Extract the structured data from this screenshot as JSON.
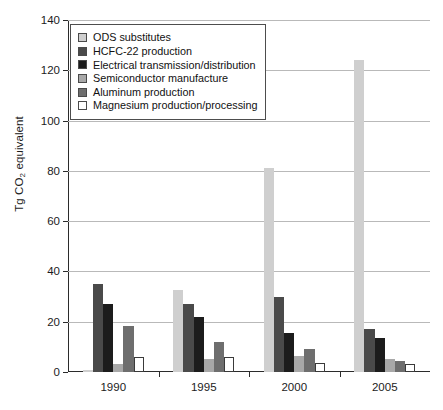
{
  "chart_data": {
    "type": "bar",
    "title": "",
    "subtitle": "",
    "xlabel": "",
    "ylabel": "Tg CO2 equivalent",
    "ylabel_parts": {
      "pre": "Tg CO",
      "sub": "2",
      "post": " equivalent"
    },
    "categories": [
      "1990",
      "1995",
      "2000",
      "2005"
    ],
    "ylim": [
      0,
      140
    ],
    "yticks": [
      0,
      20,
      40,
      60,
      80,
      100,
      120,
      140
    ],
    "ytick_labels": [
      "0",
      "20",
      "40",
      "60",
      "80",
      "100",
      "120",
      "140"
    ],
    "grid": true,
    "grid_axis": "y",
    "legend_position": "upper-left",
    "series": [
      {
        "name": "ODS substitutes",
        "color": "#cfcfcf",
        "values": [
          0.3,
          32.5,
          81.0,
          124.0
        ]
      },
      {
        "name": "HCFC-22 production",
        "color": "#4a4a4a",
        "values": [
          35.0,
          27.0,
          30.0,
          17.0
        ]
      },
      {
        "name": "Electrical transmission/distribution",
        "color": "#1c1c1c",
        "values": [
          27.0,
          22.0,
          15.5,
          13.5
        ]
      },
      {
        "name": "Semiconductor manufacture",
        "color": "#a8a8a8",
        "values": [
          3.0,
          5.0,
          6.5,
          5.0
        ]
      },
      {
        "name": "Aluminum production",
        "color": "#6e6e6e",
        "values": [
          18.5,
          12.0,
          9.0,
          4.5
        ]
      },
      {
        "name": "Magnesium production/processing",
        "color": "#ffffff",
        "values": [
          6.0,
          6.0,
          3.5,
          3.0
        ]
      }
    ]
  },
  "legend": {
    "items": [
      {
        "label": "ODS substitutes",
        "swatch": "#cfcfcf"
      },
      {
        "label": "HCFC-22 production",
        "swatch": "#4a4a4a"
      },
      {
        "label": "Electrical transmission/distribution",
        "swatch": "#1c1c1c"
      },
      {
        "label": "Semiconductor manufacture",
        "swatch": "#a8a8a8"
      },
      {
        "label": "Aluminum production",
        "swatch": "#6e6e6e"
      },
      {
        "label": "Magnesium production/processing",
        "swatch": "#ffffff"
      }
    ]
  },
  "axis_colors": {
    "axis_line": "#2b2b2b",
    "gridline": "#b9b9b9",
    "text": "#1c1c1c"
  }
}
